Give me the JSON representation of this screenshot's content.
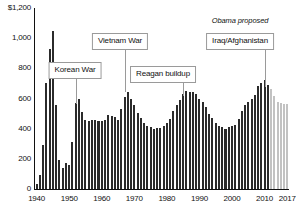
{
  "chart_data": {
    "type": "bar",
    "title": "",
    "subtitle": "",
    "xlabel": "",
    "ylabel": "",
    "y_unit_label": "$1,200",
    "ylim": [
      0,
      1200
    ],
    "xlim": [
      1940,
      2017
    ],
    "grid": false,
    "legend_position": "none",
    "y_ticks": [
      "$1,200",
      "1,000",
      "800",
      "600",
      "400",
      "200",
      "0"
    ],
    "y_tick_values": [
      1200,
      1000,
      800,
      600,
      400,
      200,
      0
    ],
    "x_ticks": [
      "1940",
      "1950",
      "1960",
      "1970",
      "1980",
      "1990",
      "2000",
      "2010",
      "2017"
    ],
    "x_tick_values": [
      1940,
      1950,
      1960,
      1970,
      1980,
      1990,
      2000,
      2010,
      2017
    ],
    "series": [
      {
        "name": "Actual",
        "color": "#2b2b2b",
        "years": [
          1940,
          1941,
          1942,
          1943,
          1944,
          1945,
          1946,
          1947,
          1948,
          1949,
          1950,
          1951,
          1952,
          1953,
          1954,
          1955,
          1956,
          1957,
          1958,
          1959,
          1960,
          1961,
          1962,
          1963,
          1964,
          1965,
          1966,
          1967,
          1968,
          1969,
          1970,
          1971,
          1972,
          1973,
          1974,
          1975,
          1976,
          1977,
          1978,
          1979,
          1980,
          1981,
          1982,
          1983,
          1984,
          1985,
          1986,
          1987,
          1988,
          1989,
          1990,
          1991,
          1992,
          1993,
          1994,
          1995,
          1996,
          1997,
          1998,
          1999,
          2000,
          2001,
          2002,
          2003,
          2004,
          2005,
          2006,
          2007,
          2008,
          2009,
          2010,
          2011
        ],
        "values": [
          30,
          95,
          290,
          700,
          930,
          1050,
          560,
          190,
          140,
          175,
          160,
          310,
          570,
          600,
          510,
          455,
          450,
          460,
          455,
          450,
          450,
          460,
          490,
          485,
          475,
          455,
          530,
          610,
          640,
          600,
          560,
          505,
          470,
          435,
          420,
          410,
          395,
          405,
          405,
          415,
          435,
          465,
          520,
          560,
          590,
          630,
          650,
          640,
          640,
          630,
          600,
          580,
          545,
          500,
          470,
          440,
          415,
          410,
          400,
          410,
          420,
          425,
          465,
          520,
          560,
          580,
          600,
          620,
          685,
          700,
          720,
          690
        ]
      },
      {
        "name": "Obama proposed",
        "color": "#c2c2c2",
        "years": [
          2012,
          2013,
          2014,
          2015,
          2016,
          2017
        ],
        "values": [
          660,
          615,
          580,
          570,
          565,
          565
        ]
      }
    ],
    "annotations": [
      {
        "label": "Korean War",
        "kind": "callout-box",
        "target_year": 1952,
        "box_center_x_px": 75,
        "box_top_px": 62,
        "leader_top_px": 78,
        "leader_bottom_px": 104
      },
      {
        "label": "Vietnam War",
        "kind": "callout-box",
        "target_year": 1967,
        "box_center_x_px": 120,
        "box_top_px": 33,
        "leader_top_px": 49,
        "leader_bottom_px": 92
      },
      {
        "label": "Reagan buildup",
        "kind": "callout-box",
        "target_year": 1985,
        "box_center_x_px": 163,
        "box_top_px": 66,
        "leader_top_px": 82,
        "leader_bottom_px": 96
      },
      {
        "label": "Iraq/Afghanistan",
        "kind": "callout-box",
        "target_year": 2010,
        "box_center_x_px": 240,
        "box_top_px": 33,
        "leader_top_px": 49,
        "leader_bottom_px": 87
      },
      {
        "label": "Obama proposed",
        "kind": "italic-note",
        "x_px": 240,
        "y_px": 17
      }
    ]
  }
}
